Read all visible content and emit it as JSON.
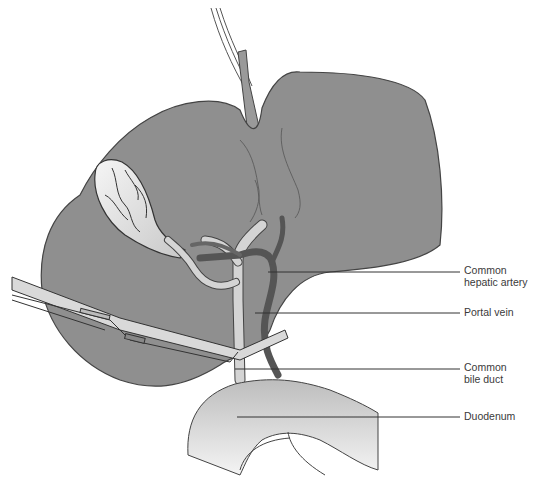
{
  "figure": {
    "colors": {
      "liver": "#8f8f8f",
      "liver_outline": "#444444",
      "gallbladder": "#e8e8e8",
      "bile_duct": "#d4d4d4",
      "artery": "#555555",
      "duodenum": "#cfcfcf",
      "leader_line": "#333333",
      "label_text": "#3a3a3a"
    }
  },
  "labels": [
    {
      "id": "common-hepatic-artery",
      "line1": "Common",
      "line2": "hepatic artery",
      "leader_y": 272,
      "leader_x1": 268
    },
    {
      "id": "portal-vein",
      "line1": "Portal vein",
      "line2": "",
      "leader_y": 313,
      "leader_x1": 255
    },
    {
      "id": "common-bile-duct",
      "line1": "Common",
      "line2": "bile duct",
      "leader_y": 369,
      "leader_x1": 235
    },
    {
      "id": "duodenum",
      "line1": "Duodenum",
      "line2": "",
      "leader_y": 417,
      "leader_x1": 237
    }
  ]
}
